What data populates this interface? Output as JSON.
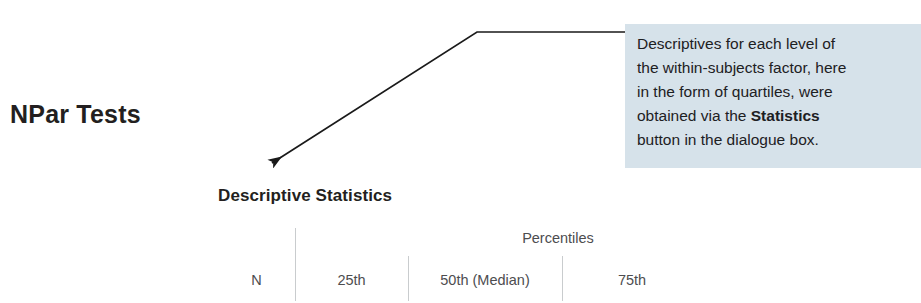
{
  "section": {
    "heading": "NPar Tests"
  },
  "callout": {
    "line1": "Descriptives for each level of",
    "line2": "the within-subjects factor, here",
    "line3": "in the form of quartiles, were",
    "line4_prefix": "obtained via the ",
    "line4_bold": "Statistics",
    "line5": "button in the dialogue box.",
    "background_color": "#d6e2ea",
    "text_color": "#1d2023"
  },
  "arrow": {
    "name": "callout-leader-arrow",
    "color": "#1a1a1a",
    "tip_x": 268,
    "tip_y": 165
  },
  "table": {
    "title": "Descriptive Statistics",
    "group_header": "Percentiles",
    "columns": [
      {
        "key": "n",
        "label": "N"
      },
      {
        "key": "p25",
        "label": "25th"
      },
      {
        "key": "p50",
        "label": "50th (Median)"
      },
      {
        "key": "p75",
        "label": "75th"
      }
    ],
    "rows": []
  }
}
